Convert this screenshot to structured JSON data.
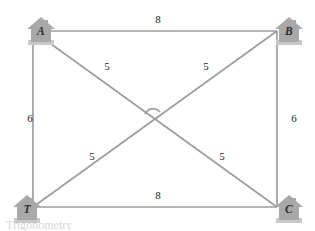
{
  "figure": {
    "type": "geometry-diagram",
    "colors": {
      "line": "#9d9d9d",
      "house_fill": "#a8a8a8",
      "house_shadow": "#c9c9c9",
      "letter": "#2b2b2b",
      "label": "#232323",
      "background": "#ffffff"
    },
    "nodes": [
      {
        "id": "A",
        "label": "A",
        "icon": "house-icon",
        "position": "top-left",
        "x": 24,
        "y": 14
      },
      {
        "id": "B",
        "label": "B",
        "icon": "house-icon",
        "position": "top-right",
        "x": 272,
        "y": 14
      },
      {
        "id": "C",
        "label": "C",
        "icon": "house-icon",
        "position": "bottom-right",
        "x": 272,
        "y": 192
      },
      {
        "id": "T",
        "label": "T",
        "icon": "house-icon",
        "position": "bottom-left",
        "x": 10,
        "y": 192
      }
    ],
    "rect": {
      "left": 33,
      "top": 31,
      "right": 277,
      "bottom": 207
    },
    "center": {
      "x": 155,
      "y": 119
    },
    "edges": [
      {
        "id": "AB",
        "from": "A",
        "to": "B",
        "length": "8",
        "side": "top",
        "label_x": 148,
        "label_y": 13
      },
      {
        "id": "TC",
        "from": "T",
        "to": "C",
        "length": "8",
        "side": "bottom",
        "label_x": 148,
        "label_y": 189
      },
      {
        "id": "AT",
        "from": "A",
        "to": "T",
        "length": "6",
        "side": "left",
        "label_x": 20,
        "label_y": 112
      },
      {
        "id": "BC",
        "from": "B",
        "to": "C",
        "length": "6",
        "side": "right",
        "label_x": 284,
        "label_y": 112
      }
    ],
    "diagonal_segments": [
      {
        "id": "A-center",
        "length": "5",
        "label_x": 97,
        "label_y": 60
      },
      {
        "id": "B-center",
        "length": "5",
        "label_x": 196,
        "label_y": 60
      },
      {
        "id": "T-center",
        "length": "5",
        "label_x": 82,
        "label_y": 150
      },
      {
        "id": "C-center",
        "length": "5",
        "label_x": 212,
        "label_y": 150
      }
    ],
    "angle_marker": {
      "at": "center",
      "type": "arc"
    }
  },
  "caption": {
    "text": "Trigonometry"
  }
}
